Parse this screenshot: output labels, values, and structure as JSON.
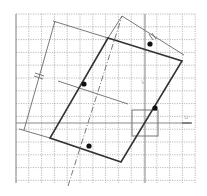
{
  "diagram": {
    "type": "geometry-grid",
    "grid": {
      "x0": 16,
      "y0": 14,
      "x1": 195,
      "y1": 183,
      "spacing": 12.8
    },
    "axes": {
      "h_y": 123,
      "v_x": 145
    },
    "parallelogram": [
      [
        108,
        38
      ],
      [
        182,
        61
      ],
      [
        121,
        162
      ],
      [
        50,
        138
      ]
    ],
    "dots": [
      [
        150,
        44
      ],
      [
        84,
        84
      ],
      [
        155,
        108
      ],
      [
        89,
        146
      ]
    ],
    "labels": {
      "center": "v",
      "axis": "u"
    },
    "colors": {
      "grid": "#a8a8a8",
      "shape": "#333333",
      "dot": "#111111",
      "thin": "#6a6a6a"
    }
  }
}
